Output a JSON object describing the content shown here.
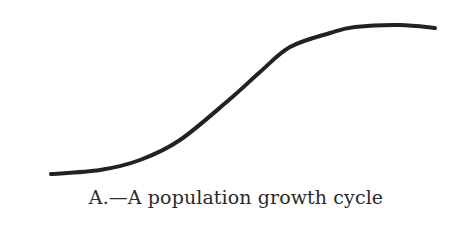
{
  "figure": {
    "caption": "A.—A population growth cycle",
    "stroke_color": "#222222",
    "background": "#ffffff"
  },
  "chart_data": {
    "type": "line",
    "title": "A.—A population growth cycle",
    "xlabel": "",
    "ylabel": "",
    "grid": false,
    "legend": null,
    "series": [
      {
        "name": "population",
        "pixel_points": [
          [
            51,
            174
          ],
          [
            100,
            170
          ],
          [
            140,
            160
          ],
          [
            180,
            140
          ],
          [
            230,
            99
          ],
          [
            260,
            72
          ],
          [
            290,
            47
          ],
          [
            330,
            33
          ],
          [
            355,
            27
          ],
          [
            400,
            25
          ],
          [
            435,
            28
          ]
        ]
      }
    ]
  }
}
